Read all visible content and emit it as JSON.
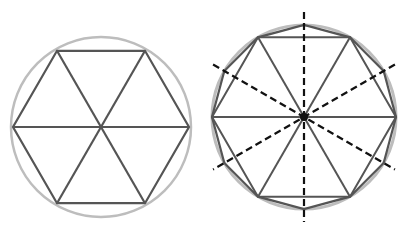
{
  "figures": [
    {
      "name": "hexagon-in-circle",
      "center": [
        101,
        127
      ],
      "radius": 90,
      "circle_color": "#bdbdbd",
      "polygon_color": "#555555",
      "sides": 6,
      "triangulated": true
    },
    {
      "name": "dodecagon-in-circle",
      "center": [
        304,
        117
      ],
      "radius": 92,
      "circle_color": "#bdbdbd",
      "polygon_color": "#555555",
      "inner_hexagon": true,
      "dodecagon": true,
      "dashed_axes_angles_deg": [
        90,
        30,
        150
      ],
      "dashed_color": "#111111",
      "dashed_extent": 105
    }
  ]
}
